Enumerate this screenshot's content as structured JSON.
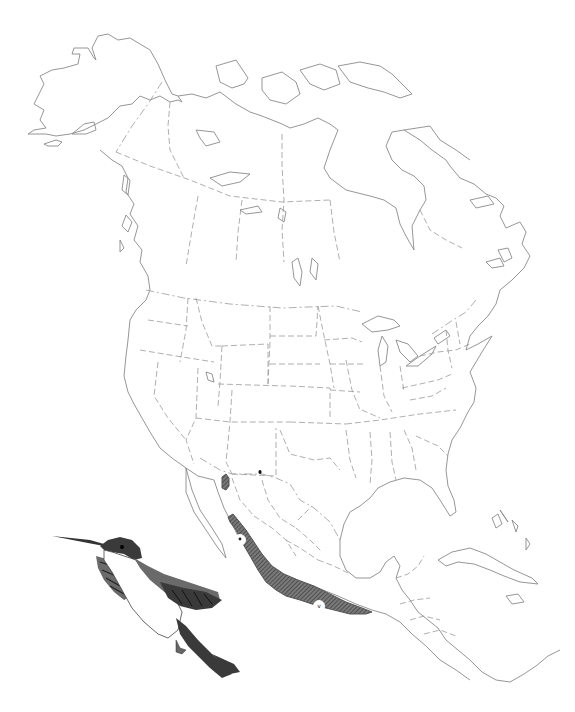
{
  "map": {
    "region": "North America",
    "style": "outline map with dashed state and province borders",
    "colors": {
      "background": "#ffffff",
      "coastline": "#8a8a8a",
      "borders": "#9a9a9a",
      "range_fill": "#6e6e6e",
      "range_pattern": "#3c3c3c"
    }
  },
  "range": {
    "description": "Shaded breeding range along western and southern Mexico",
    "northern_outlier": "small shaded patch in southeastern Arizona",
    "markers": [
      {
        "label": "•",
        "position": "northwestern Mexico (Sinaloa)"
      },
      {
        "label": "v",
        "position": "southern Mexico"
      }
    ]
  },
  "illustration": {
    "subject": "hummingbird",
    "description": "Engraved illustration of a hummingbird in flight, long thin bill, dark crown, white underparts, dark forked tail"
  }
}
